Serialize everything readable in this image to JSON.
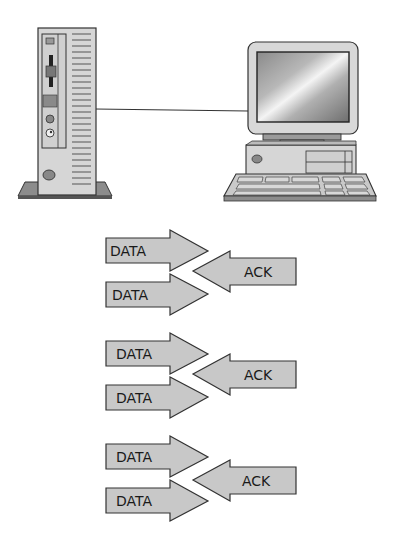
{
  "diagram": {
    "nodes": [
      {
        "id": "server",
        "label": "",
        "type": "tower-computer"
      },
      {
        "id": "client",
        "label": "",
        "type": "desktop-computer"
      }
    ],
    "connection": {
      "from": "server",
      "to": "client",
      "type": "line"
    },
    "exchanges": [
      {
        "data_1": "DATA",
        "ack": "ACK",
        "data_2": "DATA"
      },
      {
        "data_1": "DATA",
        "ack": "ACK",
        "data_2": "DATA"
      },
      {
        "data_1": "DATA",
        "ack": "ACK",
        "data_2": "DATA"
      }
    ]
  },
  "colors": {
    "arrow_fill": "#c8c8c8",
    "arrow_stroke": "#333333",
    "device_fill": "#d9d9d9",
    "device_dark": "#8c8c8c",
    "line": "#333333"
  }
}
